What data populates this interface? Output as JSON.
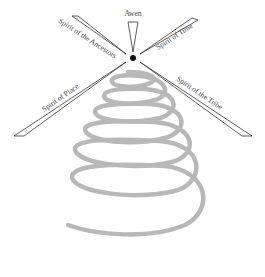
{
  "diagram": {
    "center_label": "Awen",
    "arrows": [
      {
        "id": "ancestors",
        "label": "Spirit of the Ancestors"
      },
      {
        "id": "time",
        "label": "Spirit of Time"
      },
      {
        "id": "place",
        "label": "Spirit of Place"
      },
      {
        "id": "tribe",
        "label": "Spirit of the Tribe"
      }
    ],
    "colors": {
      "arrow": "#333333",
      "spiral": "#b5b5b5",
      "dot": "#111111"
    }
  }
}
